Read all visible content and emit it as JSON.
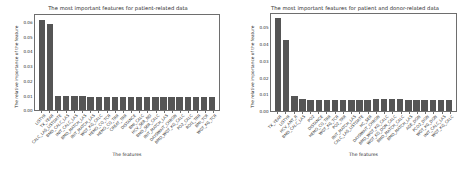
{
  "figure": {
    "background": "#ffffff",
    "bar_color": "#555555",
    "axis_color": "#6e6e6e",
    "text_color": "#2b2b2b"
  },
  "chart_data": [
    {
      "type": "bar",
      "title": "The most important features for patient-related data",
      "xlabel": "The features",
      "ylabel": "The relative importance of the feature",
      "ylim": [
        0.0,
        0.065
      ],
      "yticks": [
        "0.00",
        "0.01",
        "0.02",
        "0.03",
        "0.04",
        "0.05",
        "0.06"
      ],
      "ytick_values": [
        0.0,
        0.01,
        0.02,
        0.03,
        0.04,
        0.05,
        0.06
      ],
      "grid": false,
      "legend": "none",
      "categories": [
        "LISTYR",
        "TX_YEAR",
        "CALC_LAS_LISTDATE",
        "BMD_CALC_LAS",
        "INIT_CALC_LAS",
        "BMD_MATCH_LAS",
        "INIT_MATCH_LAS",
        "WGT_KG_CALC",
        "HEMO_CO_TCR",
        "HEMO_CO_TRR",
        "CREAT_TRR",
        "DISTANCE",
        "BMI_CALC",
        "HCV_SER_ND",
        "BMD_SER_CALC",
        "INIT_MATCH_LAS",
        "DAYSWAIT_CHRON",
        "BMD_WGT_KG_CALC",
        "PO2_CALC",
        "ROI1_TRR",
        "BMI_TCR",
        "WGT_KG_TCR"
      ],
      "values": [
        0.0615,
        0.0585,
        0.0098,
        0.0095,
        0.0095,
        0.0093,
        0.0092,
        0.0091,
        0.0091,
        0.009,
        0.009,
        0.009,
        0.009,
        0.0089,
        0.0089,
        0.0089,
        0.0088,
        0.0088,
        0.0088,
        0.0087,
        0.0087,
        0.0086
      ]
    },
    {
      "type": "bar",
      "title": "The most important features for patient and donor-related data",
      "xlabel": "The features",
      "ylabel": "The relative importance of the feature",
      "ylim": [
        0.0,
        0.058
      ],
      "yticks": [
        "0.00",
        "0.01",
        "0.02",
        "0.03",
        "0.04",
        "0.05"
      ],
      "ytick_values": [
        0.0,
        0.01,
        0.02,
        0.03,
        0.04,
        0.05
      ],
      "grid": false,
      "legend": "none",
      "categories": [
        "TX_YEAR",
        "LISTYR",
        "HCV_ANT_R",
        "BMD_CALC_LAS",
        "PO2",
        "DISTANCE",
        "HEMO_CO_TRR",
        "WGT_KG_TCR",
        "PO2_TRR",
        "INIT_MATCH_LAS",
        "CALC_LAS_LISTDATE",
        "HC_SER",
        "DAYSWAIT_CHRON",
        "BMD_WGT_KG_CALC",
        "WGT_KG_DON_CALC",
        "BMD_MATCH_CALC",
        "BMD_MATCH_LAS",
        "AGE_DON",
        "PCO2_DON",
        "WGT_KG_DON",
        "INIT_CALC_LAS",
        "WGT_KG_CALC"
      ],
      "values": [
        0.0552,
        0.0423,
        0.009,
        0.0069,
        0.0068,
        0.0068,
        0.0067,
        0.0067,
        0.0067,
        0.0066,
        0.0066,
        0.0068,
        0.007,
        0.007,
        0.0069,
        0.0069,
        0.0068,
        0.0068,
        0.0068,
        0.0068,
        0.0067,
        0.0067
      ]
    }
  ]
}
